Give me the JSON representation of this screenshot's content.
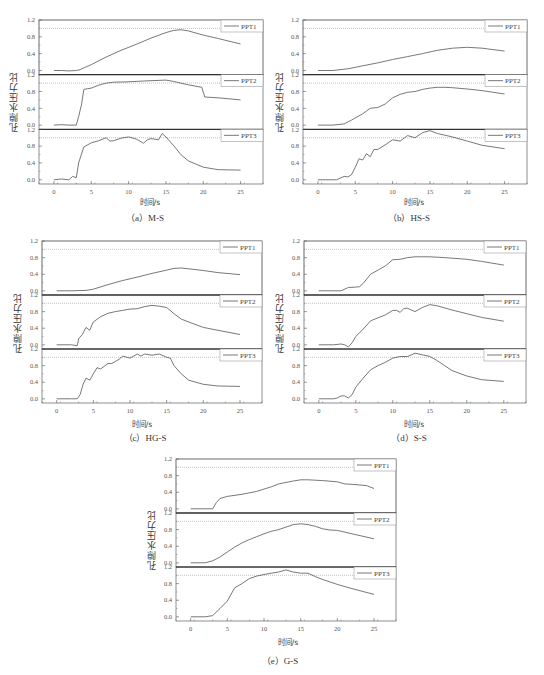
{
  "figure": {
    "ylabel": "孔隙水压力比",
    "xlabel": "时间/s",
    "x_ticks": [
      0,
      5,
      10,
      15,
      20,
      25
    ],
    "y_ticks": [
      "0.0",
      "0.4",
      "0.8",
      "1.2"
    ],
    "reference_line": 1.0
  },
  "panels": [
    {
      "id": "a",
      "caption": "（a）M-S",
      "xlabel": "时间/s",
      "ylabel": "孔隙水压力比"
    },
    {
      "id": "b",
      "caption": "（b）HS-S",
      "xlabel": "时间/s",
      "ylabel": "孔隙水压力比"
    },
    {
      "id": "c",
      "caption": "（c）HG-S",
      "xlabel": "时间/s",
      "ylabel": "孔隙水压力比"
    },
    {
      "id": "d",
      "caption": "（d）S-S",
      "xlabel": "时间/s",
      "ylabel": "孔隙水压力比"
    },
    {
      "id": "e",
      "caption": "（e）G-S",
      "xlabel": "时间/s",
      "ylabel": "孔隙水压力比"
    }
  ],
  "chart_data": [
    {
      "type": "line",
      "title": "(a) M-S",
      "xlabel": "时间/s",
      "ylabel": "孔隙水压力比",
      "xlim": [
        -2,
        28
      ],
      "ylim": [
        -0.1,
        1.2
      ],
      "grid": false,
      "legend_position": "upper right per subplot",
      "reference_line": 1.0,
      "series": [
        {
          "name": "PPT1",
          "x": [
            0,
            1,
            2,
            3,
            3.5,
            4,
            5,
            7,
            9,
            11,
            13,
            15,
            16,
            17,
            18,
            20,
            22,
            25
          ],
          "values": [
            0.0,
            0.0,
            -0.01,
            0.0,
            0.02,
            0.06,
            0.14,
            0.32,
            0.48,
            0.62,
            0.77,
            0.9,
            0.95,
            0.97,
            0.94,
            0.84,
            0.76,
            0.63
          ]
        },
        {
          "name": "PPT2",
          "x": [
            0,
            1,
            2,
            3,
            3.3,
            3.7,
            4,
            5,
            6,
            7,
            8,
            10,
            12,
            15,
            16,
            18,
            19.8,
            20.2,
            22,
            25
          ],
          "values": [
            0.0,
            0.01,
            0.0,
            0.0,
            0.2,
            0.5,
            0.85,
            0.88,
            0.95,
            1.0,
            1.02,
            1.03,
            1.05,
            1.07,
            1.04,
            0.96,
            0.9,
            0.67,
            0.65,
            0.6
          ]
        },
        {
          "name": "PPT3",
          "x": [
            0,
            1,
            2,
            2.5,
            3,
            3.3,
            4,
            5,
            6,
            7,
            7.5,
            8,
            9,
            10,
            11,
            12,
            12.5,
            13,
            14,
            14.5,
            15,
            16,
            17,
            18,
            20,
            22,
            25
          ],
          "values": [
            0.0,
            0.02,
            0.0,
            0.08,
            0.05,
            0.4,
            0.78,
            0.88,
            0.93,
            1.0,
            0.92,
            0.93,
            0.99,
            1.02,
            0.97,
            0.87,
            0.95,
            0.98,
            0.95,
            1.1,
            1.02,
            0.82,
            0.6,
            0.45,
            0.3,
            0.24,
            0.23
          ]
        }
      ]
    },
    {
      "type": "line",
      "title": "(b) HS-S",
      "xlabel": "时间/s",
      "ylabel": "孔隙水压力比",
      "xlim": [
        -2,
        28
      ],
      "ylim": [
        -0.1,
        1.2
      ],
      "grid": false,
      "reference_line": 1.0,
      "series": [
        {
          "name": "PPT1",
          "x": [
            0,
            2,
            4,
            6,
            8,
            10,
            12,
            14,
            16,
            18,
            20,
            22,
            25
          ],
          "values": [
            0.0,
            0.0,
            0.04,
            0.11,
            0.18,
            0.26,
            0.33,
            0.4,
            0.48,
            0.53,
            0.55,
            0.53,
            0.46
          ]
        },
        {
          "name": "PPT2",
          "x": [
            0,
            2,
            3.5,
            4.5,
            6,
            7,
            8,
            9,
            10,
            11,
            12,
            13,
            14,
            15,
            16,
            17,
            18,
            20,
            22,
            25
          ],
          "values": [
            0.0,
            0.0,
            0.03,
            0.12,
            0.27,
            0.4,
            0.42,
            0.5,
            0.65,
            0.73,
            0.78,
            0.8,
            0.85,
            0.88,
            0.9,
            0.9,
            0.89,
            0.86,
            0.82,
            0.74
          ]
        },
        {
          "name": "PPT3",
          "x": [
            0,
            1,
            2,
            2.5,
            3.5,
            4,
            4.5,
            5,
            5.5,
            6,
            6.5,
            7,
            7.5,
            8,
            9,
            10,
            11,
            12,
            13,
            14,
            15,
            16,
            18,
            20,
            22,
            25
          ],
          "values": [
            0.0,
            0.0,
            0.0,
            0.0,
            0.08,
            0.07,
            0.12,
            0.3,
            0.5,
            0.47,
            0.62,
            0.55,
            0.72,
            0.72,
            0.83,
            0.95,
            0.92,
            1.05,
            1.0,
            1.12,
            1.17,
            1.1,
            1.02,
            0.92,
            0.82,
            0.74
          ]
        }
      ]
    },
    {
      "type": "line",
      "title": "(c) HG-S",
      "xlabel": "时间/s",
      "ylabel": "孔隙水压力比",
      "xlim": [
        -2,
        28
      ],
      "ylim": [
        -0.1,
        1.2
      ],
      "grid": false,
      "reference_line": 1.0,
      "series": [
        {
          "name": "PPT1",
          "x": [
            0,
            2,
            4,
            5,
            7,
            9,
            11,
            13,
            15,
            16,
            17,
            18,
            20,
            22,
            25
          ],
          "values": [
            0.0,
            0.0,
            0.01,
            0.04,
            0.15,
            0.25,
            0.33,
            0.42,
            0.5,
            0.54,
            0.55,
            0.53,
            0.49,
            0.44,
            0.39
          ]
        },
        {
          "name": "PPT2",
          "x": [
            0,
            1,
            2,
            2.8,
            3,
            3.5,
            4,
            4.5,
            5,
            6,
            7,
            8,
            9,
            10,
            11,
            12,
            13,
            14,
            15,
            16,
            17,
            18,
            20,
            22,
            25
          ],
          "values": [
            0.0,
            0.0,
            0.0,
            -0.02,
            0.15,
            0.25,
            0.42,
            0.35,
            0.55,
            0.68,
            0.76,
            0.8,
            0.83,
            0.86,
            0.87,
            0.92,
            0.95,
            0.93,
            0.9,
            0.75,
            0.62,
            0.55,
            0.42,
            0.35,
            0.25
          ]
        },
        {
          "name": "PPT3",
          "x": [
            0,
            1,
            2,
            2.8,
            3.2,
            3.6,
            4,
            4.5,
            5,
            5.5,
            6,
            7,
            7.5,
            8,
            8.5,
            9,
            10,
            11,
            11.5,
            12,
            13,
            14,
            15,
            15.5,
            16,
            17,
            18,
            20,
            22,
            25
          ],
          "values": [
            0.0,
            0.0,
            0.0,
            0.0,
            0.1,
            0.35,
            0.5,
            0.45,
            0.6,
            0.75,
            0.72,
            0.85,
            0.85,
            0.9,
            0.95,
            1.03,
            0.98,
            1.08,
            1.03,
            1.08,
            1.05,
            1.08,
            1.0,
            0.98,
            0.8,
            0.6,
            0.45,
            0.35,
            0.31,
            0.3
          ]
        }
      ]
    },
    {
      "type": "line",
      "title": "(d) S-S",
      "xlabel": "时间/s",
      "ylabel": "孔隙水压力比",
      "xlim": [
        -2,
        28
      ],
      "ylim": [
        -0.1,
        1.2
      ],
      "grid": false,
      "reference_line": 1.0,
      "series": [
        {
          "name": "PPT1",
          "x": [
            0,
            2,
            3,
            4,
            5,
            5.5,
            6,
            7,
            8,
            9,
            10,
            11,
            12,
            13,
            15,
            17,
            20,
            22,
            25
          ],
          "values": [
            0.0,
            0.0,
            0.0,
            0.08,
            0.09,
            0.1,
            0.18,
            0.4,
            0.5,
            0.6,
            0.75,
            0.76,
            0.8,
            0.82,
            0.82,
            0.8,
            0.76,
            0.71,
            0.62
          ]
        },
        {
          "name": "PPT2",
          "x": [
            0,
            1,
            2,
            3,
            3.5,
            4,
            4.5,
            5,
            6,
            7,
            8,
            9,
            10,
            10.5,
            11,
            11.5,
            12,
            13,
            14,
            15,
            16,
            18,
            20,
            22,
            25
          ],
          "values": [
            0.0,
            0.0,
            0.0,
            0.02,
            0.0,
            -0.05,
            0.05,
            0.2,
            0.38,
            0.58,
            0.65,
            0.72,
            0.83,
            0.83,
            0.78,
            0.88,
            0.88,
            0.8,
            0.9,
            0.97,
            0.94,
            0.84,
            0.75,
            0.66,
            0.57
          ]
        },
        {
          "name": "PPT3",
          "x": [
            0,
            1,
            2,
            2.5,
            3,
            3.5,
            4,
            4.5,
            5,
            6,
            7,
            8,
            9,
            10,
            11,
            12,
            13,
            14,
            15,
            16,
            17,
            18,
            20,
            22,
            25
          ],
          "values": [
            0.0,
            0.0,
            0.0,
            0.02,
            0.07,
            0.07,
            0.02,
            0.1,
            0.28,
            0.5,
            0.7,
            0.8,
            0.88,
            0.98,
            1.02,
            1.02,
            1.1,
            1.06,
            1.02,
            0.92,
            0.8,
            0.68,
            0.55,
            0.46,
            0.42
          ]
        }
      ]
    },
    {
      "type": "line",
      "title": "(e) G-S",
      "xlabel": "时间/s",
      "ylabel": "孔隙水压力比",
      "xlim": [
        -2,
        28
      ],
      "ylim": [
        -0.1,
        1.2
      ],
      "grid": false,
      "reference_line": 1.0,
      "series": [
        {
          "name": "PPT1",
          "x": [
            0,
            1,
            2,
            3,
            3.5,
            4,
            5,
            7,
            9,
            11,
            12,
            14,
            15,
            16,
            18,
            20,
            21,
            22,
            24,
            25
          ],
          "values": [
            0.0,
            0.0,
            0.0,
            0.0,
            0.15,
            0.25,
            0.3,
            0.35,
            0.42,
            0.53,
            0.6,
            0.67,
            0.7,
            0.7,
            0.68,
            0.65,
            0.6,
            0.59,
            0.56,
            0.49
          ]
        },
        {
          "name": "PPT2",
          "x": [
            0,
            2,
            3,
            4,
            5,
            6,
            7,
            8,
            9,
            10,
            11,
            12,
            13,
            14,
            15,
            16,
            17,
            18,
            19,
            20,
            22,
            25
          ],
          "values": [
            0.0,
            0.0,
            0.05,
            0.14,
            0.26,
            0.38,
            0.48,
            0.56,
            0.63,
            0.7,
            0.76,
            0.8,
            0.86,
            0.92,
            0.94,
            0.92,
            0.88,
            0.82,
            0.79,
            0.78,
            0.7,
            0.58
          ]
        },
        {
          "name": "PPT3",
          "x": [
            0,
            1,
            2,
            3,
            4,
            5,
            6,
            7,
            8,
            9,
            10,
            11,
            12,
            13,
            14,
            15,
            16,
            17,
            18,
            20,
            22,
            25
          ],
          "values": [
            0.0,
            0.0,
            0.0,
            0.03,
            0.2,
            0.38,
            0.7,
            0.8,
            0.92,
            0.98,
            1.02,
            1.05,
            1.08,
            1.13,
            1.08,
            1.05,
            1.05,
            0.97,
            0.9,
            0.78,
            0.68,
            0.54
          ]
        }
      ]
    }
  ]
}
